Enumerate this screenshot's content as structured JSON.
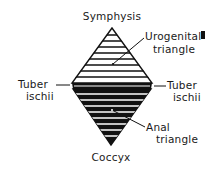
{
  "diagram": {
    "labels": {
      "top": "Symphysis",
      "bottom": "Coccyx",
      "left_line1": "Tuber",
      "left_line2": "ischii",
      "right_line1": "Tuber",
      "right_line2": "ischii",
      "urogenital_line1": "Urogenital",
      "urogenital_line2": "triangle",
      "anal_line1": "Anal",
      "anal_line2": "triangle"
    },
    "regions": [
      {
        "name": "Urogenital triangle",
        "fill": "#ffffff",
        "stripe": "#111111"
      },
      {
        "name": "Anal triangle",
        "fill": "#111111",
        "stripe": "#ffffff"
      }
    ],
    "colors": {
      "ink": "#111111",
      "paper": "#ffffff"
    }
  }
}
